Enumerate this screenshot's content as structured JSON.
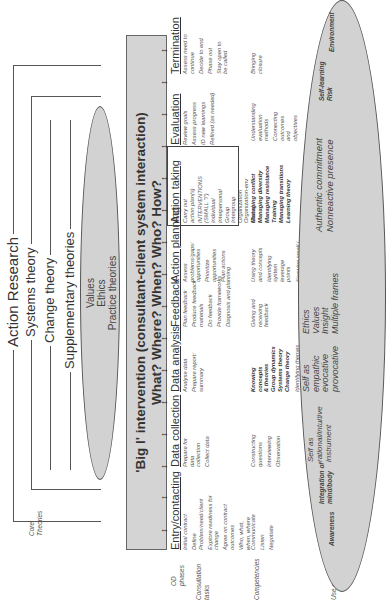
{
  "theories": {
    "action_research": "Action Research",
    "systems_theory": "Systems theory",
    "change_theory": "Change theory",
    "supplementary_theories": "Supplementary theories",
    "core_label": [
      "Core",
      "Theories"
    ],
    "ellipse_lines": [
      "Values",
      "Ethics",
      "Practice theories"
    ]
  },
  "intervention": {
    "line1": "'Big I' intervention (consultant-client system interaction)",
    "line2": "What? Where? When? Who? How?"
  },
  "row_labels": {
    "od_phases": [
      "OD",
      "phases"
    ],
    "consultation_tasks": [
      "Consultation",
      "tasks"
    ],
    "competencies": "Competencies",
    "use_of_self": "Use of self"
  },
  "phases": [
    {
      "title": "Entry/contacting",
      "tasks": [
        "Initial contract",
        "Define Problem/need/client",
        "Explore readiness for change",
        "Agree on contract outcomes",
        "Who, what, when, where"
      ]
    },
    {
      "title": "Data collection",
      "tasks": [
        "Prepare for data collection",
        "Collect data"
      ]
    },
    {
      "title": "Data analysis",
      "tasks": [
        "Analyse data",
        "Prepare report/ summary"
      ]
    },
    {
      "title": "Feedback",
      "tasks": [
        "Plan feedback",
        "Produce feedback materials",
        "Do feedback",
        "Provide frameworks",
        "Diagnosis and planning"
      ]
    },
    {
      "title": "Action planning",
      "tasks": [
        "Assess problems/gaps/ opportunities",
        "Prioritize opportunities",
        "Plan actions"
      ]
    },
    {
      "title": "Action taking",
      "tasks": [
        "Carry out action plan(s)",
        "INTERVENTIONS (SMALL \"i\")",
        "Individual",
        "Interpersonal",
        "Group",
        "Intergroup",
        "Organization",
        "Organization-env",
        "Global"
      ]
    },
    {
      "title": "Evaluation",
      "tasks": [
        "Review goals",
        "Assess progress",
        "ID new learnings",
        "Refined (as needed)"
      ]
    },
    {
      "title": "Termination",
      "tasks": [
        "Assess need to continue",
        "Decide to end",
        "Phase out",
        "Stay open to be called"
      ]
    }
  ],
  "competencies": [
    [
      "Communicate",
      "Listen",
      "Negotiate"
    ],
    [
      "Constructing questions",
      "Interviewing",
      "Observation"
    ],
    {
      "bold": [
        "Knowing concepts & theories",
        "Group dynamics",
        "Systems theory",
        "Change theory"
      ],
      "regular": [
        "Identifying themes",
        "Summarizing"
      ]
    },
    [
      "Giving and receiving feedback"
    ],
    [
      "Using theory and concepts",
      "Identifying system leverage points",
      "Knowing small i interventions"
    ],
    {
      "bold": [
        "Managing conflict",
        "Managing diversity",
        "Managing resistance",
        "Training",
        "Managing transitions",
        "Learning theory"
      ],
      "regular": []
    },
    [
      "Understanding evaluation methods",
      "Connecting outcomes and objectives"
    ],
    [
      "Bringing closure"
    ]
  ],
  "use_of_self": [
    {
      "lines": [
        "Awareness"
      ],
      "bold": true
    },
    {
      "lines": [
        "Integration of",
        "mind/body"
      ],
      "bold": true
    },
    {
      "lines": [
        "Self as",
        "rational/intuitive",
        "instrument"
      ],
      "bold": false
    },
    {
      "lines": [
        "Self as",
        "empathic",
        "evocative",
        "provocative"
      ],
      "bold": false
    },
    {
      "lines": [
        "Ethics",
        "Values",
        "Insight",
        "Multiple frames"
      ],
      "bold": false
    },
    {
      "lines": [
        "Authentic commitment",
        "Nonreactive presence"
      ],
      "bold": false
    },
    {
      "lines": [
        "Self-learning",
        "Risk"
      ],
      "bold": true
    },
    {
      "lines": [
        "Environment"
      ],
      "bold": true
    }
  ],
  "arrow_glyph": "↔"
}
